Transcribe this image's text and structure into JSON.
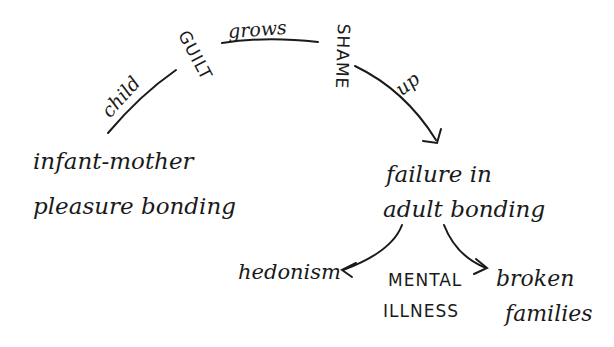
{
  "diagram": {
    "nodes": {
      "start": {
        "line1": "infant-mother",
        "line2": "pleasure bonding"
      },
      "middle": {
        "line1": "failure in",
        "line2": "adult bonding"
      },
      "outcome_left": {
        "label": "hedonism"
      },
      "outcome_center": {
        "line1": "MENTAL",
        "line2": "ILLNESS"
      },
      "outcome_right": {
        "line1": "broken",
        "line2": "families"
      }
    },
    "arc_labels": {
      "child": "child",
      "guilt": "GUILT",
      "grows": "grows",
      "shame": "SHAME",
      "up": "up"
    },
    "colors": {
      "ink": "#1a1a1a",
      "paper": "#ffffff"
    }
  }
}
